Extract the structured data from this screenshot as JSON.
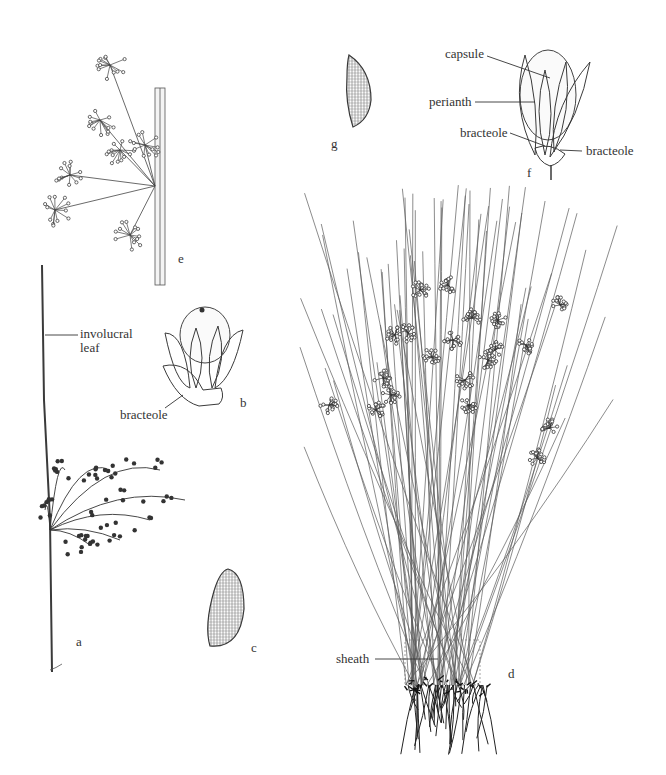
{
  "figure": {
    "colors": {
      "ink": "#3a3a3a",
      "background": "#ffffff"
    }
  },
  "panels": {
    "a": {
      "letter": "a",
      "description": "Flowering stem with inflorescence",
      "labels": [
        "involucral\nleaf"
      ]
    },
    "b": {
      "letter": "b",
      "description": "Flower with bracteole",
      "labels": [
        "bracteole"
      ]
    },
    "c": {
      "letter": "c",
      "description": "Seed (reticulate)"
    },
    "d": {
      "letter": "d",
      "description": "Habit of whole tufted plant",
      "labels": [
        "sheath"
      ]
    },
    "e": {
      "letter": "e",
      "description": "Inflorescence detail on stem"
    },
    "f": {
      "letter": "f",
      "description": "Flower detail",
      "labels": [
        "capsule",
        "perianth",
        "bracteole",
        "bracteole"
      ]
    },
    "g": {
      "letter": "g",
      "description": "Seed (reticulate)"
    }
  },
  "labels": {
    "involucral_line1": "involucral",
    "involucral_line2": "leaf",
    "bracteole_b": "bracteole",
    "capsule": "capsule",
    "perianth": "perianth",
    "bracteole_f_left": "bracteole",
    "bracteole_f_right": "bracteole",
    "sheath": "sheath"
  },
  "letters": {
    "a": "a",
    "b": "b",
    "c": "c",
    "d": "d",
    "e": "e",
    "f": "f",
    "g": "g"
  }
}
